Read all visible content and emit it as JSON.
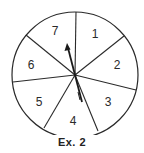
{
  "diagram": {
    "type": "spinner",
    "caption": "Ex. 2",
    "sections": [
      {
        "label": "1",
        "x": 95,
        "y": 38
      },
      {
        "label": "2",
        "x": 117,
        "y": 69
      },
      {
        "label": "3",
        "x": 108,
        "y": 106
      },
      {
        "label": "4",
        "x": 73,
        "y": 125
      },
      {
        "label": "5",
        "x": 39,
        "y": 106
      },
      {
        "label": "6",
        "x": 31,
        "y": 69
      },
      {
        "label": "7",
        "x": 55,
        "y": 35
      }
    ],
    "colors": {
      "stroke": "#2a2a2a",
      "background": "#ffffff"
    }
  }
}
